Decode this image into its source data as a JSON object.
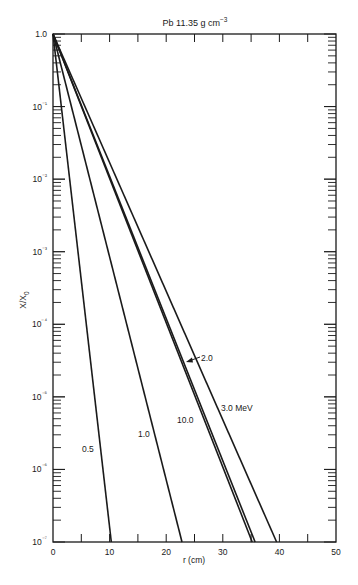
{
  "chart_data": {
    "type": "line",
    "xlabel": "r (cm)",
    "ylabel": "X/X₀",
    "xlim": [
      0,
      50
    ],
    "ylim": [
      1e-07,
      1.0
    ],
    "yscale": "log",
    "grid": false,
    "x_ticks": [
      0,
      10,
      20,
      30,
      40,
      50
    ],
    "x_minor_ticks": [
      5,
      15,
      25,
      35,
      45
    ],
    "y_ticks": [
      {
        "value": 1.0,
        "label": "1.0"
      },
      {
        "value": 0.1,
        "label": "10⁻¹"
      },
      {
        "value": 0.01,
        "label": "10⁻²"
      },
      {
        "value": 0.001,
        "label": "10⁻³"
      },
      {
        "value": 0.0001,
        "label": "10⁻⁴"
      },
      {
        "value": 1e-05,
        "label": "10⁻⁵"
      },
      {
        "value": 1e-06,
        "label": "10⁻⁶"
      },
      {
        "value": 1e-07,
        "label": "10⁻⁷"
      }
    ],
    "series": [
      {
        "name": "0.5 MeV",
        "label": "0.5",
        "x": [
          0,
          10.3
        ],
        "y": [
          1.0,
          1e-07
        ]
      },
      {
        "name": "1.0 MeV",
        "label": "1.0",
        "x": [
          0,
          22.8
        ],
        "y": [
          1.0,
          1e-07
        ]
      },
      {
        "name": "10.0 MeV",
        "label": "10.0",
        "x": [
          0,
          35.2
        ],
        "y": [
          1.0,
          1e-07
        ]
      },
      {
        "name": "2.0 MeV",
        "label": "2.0",
        "x": [
          0,
          35.7
        ],
        "y": [
          1.0,
          1e-07
        ]
      },
      {
        "name": "3.0 MeV",
        "label": "3.0 MeV",
        "x": [
          0,
          39.5
        ],
        "y": [
          1.0,
          1e-07
        ]
      }
    ],
    "annotations": [
      {
        "text": "0.5",
        "series": "0.5 MeV"
      },
      {
        "text": "1.0",
        "series": "1.0 MeV"
      },
      {
        "text": "10.0",
        "series": "10.0 MeV"
      },
      {
        "text": "2.0",
        "series": "2.0 MeV",
        "arrow": true
      },
      {
        "text": "3.0 MeV",
        "series": "3.0 MeV"
      }
    ]
  },
  "labels": {
    "title": "Pb 11.35 g cm",
    "title_sup": "−3",
    "xlabel": "r (cm)",
    "ylabel_main": "X/X",
    "ylabel_sub": "0",
    "curve_05": "0.5",
    "curve_10": "1.0",
    "curve_100": "10.0",
    "curve_20": "2.0",
    "curve_30": "3.0 MeV"
  },
  "colors": {
    "line": "#1a1a1a",
    "background": "#ffffff"
  }
}
